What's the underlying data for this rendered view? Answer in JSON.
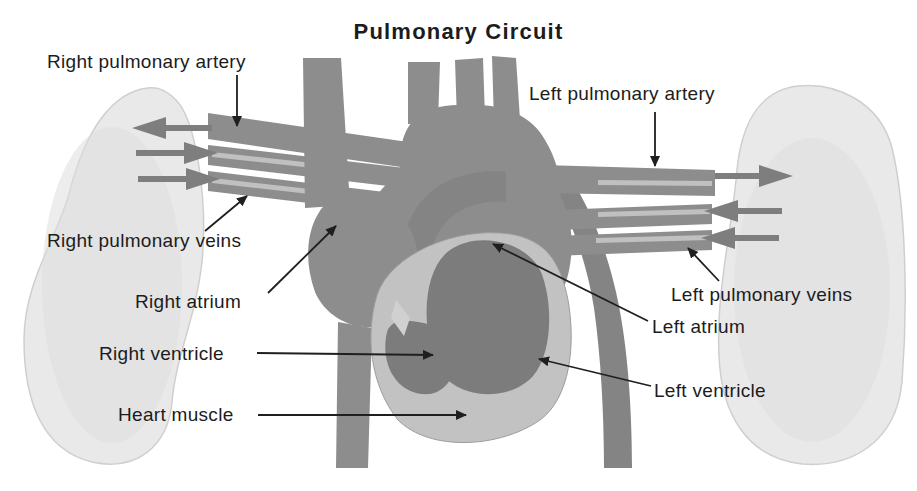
{
  "title": "Pulmonary Circuit",
  "labels": {
    "right_pulmonary_artery": "Right pulmonary artery",
    "right_pulmonary_veins": "Right pulmonary veins",
    "right_atrium": "Right atrium",
    "right_ventricle": "Right ventricle",
    "heart_muscle": "Heart muscle",
    "left_pulmonary_artery": "Left pulmonary artery",
    "left_pulmonary_veins": "Left pulmonary veins",
    "left_atrium": "Left atrium",
    "left_ventricle": "Left ventricle"
  },
  "flow_arrows": {
    "left_lung_directions": [
      "left",
      "right",
      "right"
    ],
    "right_lung_directions": [
      "right",
      "left",
      "left"
    ]
  },
  "colors": {
    "background": "#ffffff",
    "lung": "#e9e9e9",
    "lung_shade": "#dfdfdf",
    "lung_edge": "#cfcfcf",
    "vessel": "#8d8d8d",
    "vessel_dark": "#848484",
    "vessel_stripe": "#c9c9c9",
    "heart_chamber": "#7c7c7c",
    "heart_muscle": "#c2c2c2",
    "valve": "#d0d0d0",
    "flow_arrow": "#7e7e7e",
    "label_text": "#1c1c1c",
    "pointer": "#1f1f1f"
  }
}
